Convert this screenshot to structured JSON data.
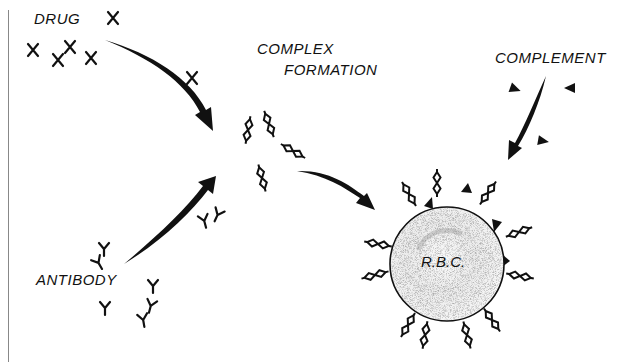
{
  "labels": {
    "drug": "DRUG",
    "antibody": "ANTIBODY",
    "complex_line1": "COMPLEX",
    "complex_line2": "FORMATION",
    "complement": "COMPLEMENT",
    "rbc": "R.B.C."
  },
  "symbols": {
    "drug": "X",
    "antibody": "Y",
    "complement": "triangle",
    "complex": "double-helix-chain"
  },
  "colors": {
    "ink": "#111111",
    "background": "#ffffff",
    "cell_fill": "#f2f2f2",
    "cell_stipple": "#9a9a9a"
  },
  "flow": [
    {
      "from": "DRUG",
      "to": "COMPLEX FORMATION"
    },
    {
      "from": "ANTIBODY",
      "to": "COMPLEX FORMATION"
    },
    {
      "from": "COMPLEX FORMATION",
      "to": "R.B.C."
    },
    {
      "from": "COMPLEMENT",
      "to": "R.B.C."
    }
  ]
}
